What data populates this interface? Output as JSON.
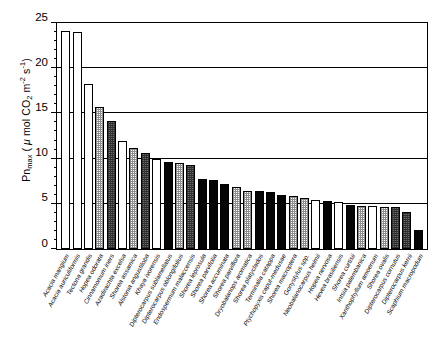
{
  "chart_data": {
    "type": "bar",
    "title": "",
    "xlabel": "",
    "ylabel": "Pnmax ( μ mol CO2 m-2 s-1)",
    "ylabel_parts": {
      "prefix": "Pn",
      "sub1": "max",
      "open": " ( ",
      "mu": "μ",
      "mid": " mol CO",
      "sub2": "2",
      "space": " m",
      "sup1": "-2",
      "space2": " s",
      "sup2": "-1",
      "close": ")"
    },
    "ylim": [
      0,
      25
    ],
    "yticks": [
      0,
      5,
      10,
      15,
      20,
      25
    ],
    "ytick_labels": [
      "0",
      "5",
      "10",
      "15",
      "20",
      "25"
    ],
    "minor_tick_interval": 1,
    "grid": true,
    "legend": "none",
    "categories": [
      "Acacia mangium",
      "Acacia auriculiformis",
      "Tectona grandis",
      "Hopea odorata",
      "Cinnamomum iners",
      "Azadirachta excelsa",
      "Shorea assamica",
      "Alstonia angustiloba",
      "Khaya ivorensis",
      "Dipterocarpus sublamellatus",
      "Dipterocarpus oblongifolius",
      "Endospermum malaccensis",
      "Shorea leprosula",
      "Shorea parvifolia",
      "Shorea accuminata",
      "Shorea parviflora",
      "Dryobalanops aromatica",
      "Shorea platyclados",
      "Terminalia catappa",
      "Ptychopyxis caput-medusae",
      "Shorea macroptera",
      "Gonystylus spp.",
      "Neobalanocarpus heimii",
      "Hopea nervosa",
      "Hevea brasiliensis",
      "Shorea curtisii",
      "Intsia palembanica",
      "Xanthophyllum amoenum",
      "Shorea ovalis",
      "Dipterocarpus cornutus",
      "Dipterocarpus kerrii",
      "Scaphium macropodum"
    ],
    "values": [
      24.1,
      24.0,
      18.2,
      15.7,
      14.2,
      12.0,
      11.2,
      10.6,
      10.0,
      9.6,
      9.5,
      9.3,
      7.7,
      7.6,
      7.2,
      6.9,
      6.4,
      6.4,
      6.3,
      6.0,
      5.9,
      5.6,
      5.4,
      5.3,
      5.2,
      4.9,
      4.8,
      4.8,
      4.7,
      4.6,
      4.1,
      2.1
    ],
    "fills": [
      "open",
      "open",
      "open",
      "stipple",
      "dark",
      "open",
      "stipple",
      "dark",
      "open",
      "solid",
      "stipple",
      "dark",
      "solid",
      "solid",
      "solid",
      "stipple",
      "stipple",
      "solid",
      "solid",
      "solid",
      "stipple",
      "stipple",
      "open",
      "solid",
      "open",
      "solid",
      "stipple",
      "open",
      "stipple",
      "dark",
      "dark",
      "solid"
    ],
    "fill_legend_names": {
      "open": "open-white-bar",
      "stipple": "light-checkered-bar",
      "dark": "dark-hatched-bar",
      "solid": "solid-black-bar"
    }
  }
}
